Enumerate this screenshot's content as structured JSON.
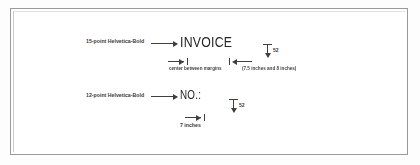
{
  "figure": {
    "background_color": "#ffffff",
    "ink_color": "#3f3f3f",
    "frame_color": "#9a9a9a"
  },
  "annotations": {
    "invoice_spec_label": "15-point Helvetica-Bold",
    "no_spec_label": "12-point Helvetica-Bold"
  },
  "specimens": {
    "invoice_text": "INVOICE",
    "no_text": "NO.:"
  },
  "measurements": {
    "invoice_leading": "52",
    "no_leading": "52",
    "center_caption": "center between margins",
    "center_caption_range": "(7.5 inches and 8 inches)",
    "no_offset_caption": "7 inches"
  }
}
